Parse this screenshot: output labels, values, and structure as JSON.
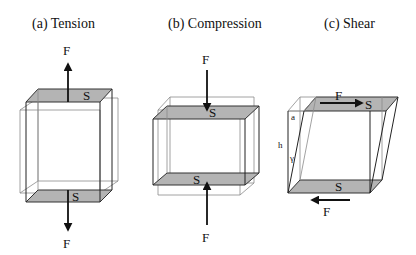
{
  "colors": {
    "background": "#ffffff",
    "shaded_face": "#b4b4b4",
    "edge": "#222222",
    "ghost_edge": "#8a8a8a",
    "arrow": "#111111"
  },
  "panels": [
    {
      "id": "tension",
      "title": "(a) Tension",
      "force_top_label": "F",
      "force_bottom_label": "F",
      "surface_top_label": "S",
      "surface_bottom_label": "S"
    },
    {
      "id": "compression",
      "title": "(b) Compression",
      "force_top_label": "F",
      "force_bottom_label": "F",
      "surface_top_label": "S",
      "surface_bottom_label": "S"
    },
    {
      "id": "shear",
      "title": "(c) Shear",
      "force_top_label": "F",
      "force_bottom_label": "F",
      "surface_top_label": "S",
      "surface_bottom_label": "S",
      "displacement_label": "a",
      "height_label": "h",
      "angle_label": "γ"
    }
  ]
}
